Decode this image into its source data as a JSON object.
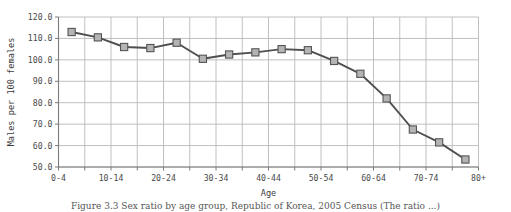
{
  "chart_data": {
    "type": "line",
    "title": "",
    "xlabel": "Age",
    "ylabel": "Males per 100 females",
    "categories": [
      "0-4",
      "5-9",
      "10-14",
      "15-19",
      "20-24",
      "25-29",
      "30-34",
      "35-39",
      "40-44",
      "45-49",
      "50-54",
      "55-59",
      "60-64",
      "65-69",
      "70-74",
      "75-79"
    ],
    "values": [
      113.0,
      110.5,
      106.0,
      105.5,
      108.0,
      100.5,
      102.5,
      103.5,
      105.0,
      104.5,
      99.5,
      93.5,
      82.0,
      67.5,
      61.5,
      53.5
    ],
    "series": [
      {
        "name": "Males per 100 females",
        "values": [
          113.0,
          110.5,
          106.0,
          105.5,
          108.0,
          100.5,
          102.5,
          103.5,
          105.0,
          104.5,
          99.5,
          93.5,
          82.0,
          67.5,
          61.5,
          53.5
        ]
      }
    ],
    "x_tick_labels": [
      "0-4",
      "",
      "10-14",
      "",
      "20-24",
      "",
      "30-34",
      "",
      "40-44",
      "",
      "50-54",
      "",
      "60-64",
      "",
      "70-74",
      "",
      "80+"
    ],
    "x_tick_labels_shown": [
      "0-4",
      "10-14",
      "20-24",
      "30-34",
      "40-44",
      "50-54",
      "60-64",
      "70-74",
      "80+"
    ],
    "y_tick_labels": [
      "120.0",
      "110.0",
      "100.0",
      "90.0",
      "80.0",
      "70.0",
      "60.0",
      "50.0"
    ],
    "y_ticks": [
      120.0,
      110.0,
      100.0,
      90.0,
      80.0,
      70.0,
      60.0,
      50.0
    ],
    "ylim": [
      50.0,
      120.0
    ],
    "xlim_index": [
      0,
      16
    ],
    "grid": "both",
    "legend": "none",
    "marker": "square",
    "colors": {
      "line": "#4f4f4f",
      "marker_fill": "#b4b4b4",
      "marker_edge": "#555555",
      "grid": "#b9b9b9",
      "axis": "#7a7a7a",
      "text": "#4a4a4a",
      "background": "#ffffff"
    }
  },
  "caption": {
    "text": "Figure 3.3 Sex ratio by age group, Republic of Korea, 2005 Census (The ratio ...)"
  }
}
